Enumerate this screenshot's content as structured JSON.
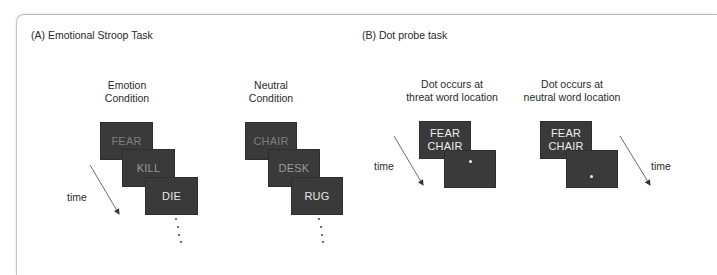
{
  "panel_a": {
    "title": "(A) Emotional Stroop Task",
    "emotion_condition": {
      "label_line1": "Emotion",
      "label_line2": "Condition",
      "words": [
        "FEAR",
        "KILL",
        "DIE"
      ]
    },
    "neutral_condition": {
      "label_line1": "Neutral",
      "label_line2": "Condition",
      "words": [
        "CHAIR",
        "DESK",
        "RUG"
      ]
    },
    "time_label": "time"
  },
  "panel_b": {
    "title": "(B) Dot probe task",
    "threat_location": {
      "label_line1": "Dot occurs at",
      "label_line2": "threat word location",
      "top_word": "FEAR",
      "bottom_word": "CHAIR",
      "probe_symbol": "•"
    },
    "neutral_location": {
      "label_line1": "Dot occurs at",
      "label_line2": "neutral word location",
      "top_word": "FEAR",
      "bottom_word": "CHAIR",
      "probe_symbol": "•"
    },
    "time_label_left": "time",
    "time_label_right": "time"
  },
  "colors": {
    "box_fill": "#3a3a3a",
    "frame_border": "#b9b9b9",
    "text": "#2a2a2a"
  }
}
